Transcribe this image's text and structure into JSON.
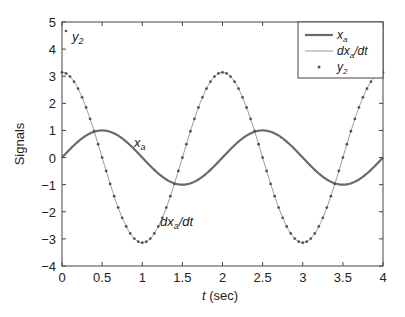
{
  "chart_data": {
    "type": "line",
    "title": "",
    "xlabel": "t (sec)",
    "ylabel": "Signals",
    "xlim": [
      0,
      4
    ],
    "ylim": [
      -4,
      5
    ],
    "xticks": [
      "0",
      "0.5",
      "1",
      "1.5",
      "2",
      "2.5",
      "3",
      "3.5",
      "4"
    ],
    "yticks": [
      "-4",
      "-3",
      "-2",
      "-1",
      "0",
      "1",
      "2",
      "3",
      "4",
      "5"
    ],
    "grid": false,
    "legend_position": "upper right",
    "series": [
      {
        "name": "x_a",
        "function": "sin(pi t)",
        "style": "thick line",
        "color": "#6a6a6a"
      },
      {
        "name": "dx_a/dt",
        "function": "pi cos(pi t)",
        "style": "thin line",
        "color": "#9a9a9a"
      },
      {
        "name": "y_2",
        "function": "pi cos(pi t) sampled every 0.05 s",
        "style": "dot markers",
        "color": "#555555"
      }
    ],
    "annotations": [
      {
        "text": "x_a",
        "t": 0.75,
        "y": 0.9
      },
      {
        "text": "dx_a/dt",
        "t": 1.3,
        "y": -2.4
      },
      {
        "text": "y_2",
        "t": 0.1,
        "y": 4.5
      }
    ]
  },
  "legend": {
    "items": [
      {
        "label_main": "x",
        "label_sub": "a",
        "label_tail": ""
      },
      {
        "label_main": "dx",
        "label_sub": "a",
        "label_tail": "/dt"
      },
      {
        "label_main": "y",
        "label_sub": "2",
        "label_tail": ""
      }
    ]
  }
}
